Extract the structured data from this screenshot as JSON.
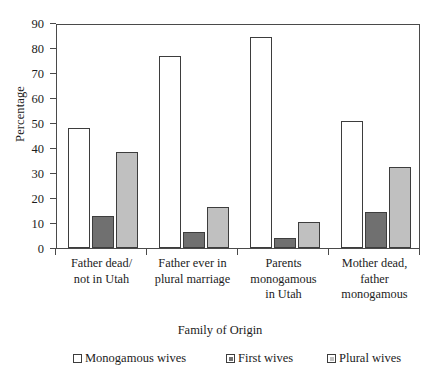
{
  "chart_data": {
    "type": "bar",
    "title": "",
    "xlabel": "Family of Origin",
    "ylabel": "Percentage",
    "ylim": [
      0,
      90
    ],
    "yticks": [
      0,
      10,
      20,
      30,
      40,
      50,
      60,
      70,
      80,
      90
    ],
    "grid": false,
    "legend_position": "bottom",
    "categories": [
      "Father dead/ not in Utah",
      "Father ever in plural marriage",
      "Parents monogamous in Utah",
      "Mother dead, father monogamous"
    ],
    "category_lines": [
      [
        "Father dead/",
        "not  in Utah"
      ],
      [
        "Father ever in",
        "plural marriage"
      ],
      [
        "Parents",
        "monogamous",
        "in Utah"
      ],
      [
        "Mother dead,",
        "father",
        "monogamous"
      ]
    ],
    "series": [
      {
        "name": "Monogamous wives",
        "color": "#ffffff",
        "values": [
          48,
          77,
          84.5,
          51
        ]
      },
      {
        "name": "First wives",
        "color": "#707070",
        "values": [
          13,
          6.5,
          4,
          14.5
        ]
      },
      {
        "name": "Plural wives",
        "color": "#c0c0c0",
        "values": [
          38.5,
          16.5,
          10.5,
          32.5
        ]
      }
    ]
  },
  "legend": {
    "items": [
      {
        "label": "Monogamous wives",
        "color": "#ffffff"
      },
      {
        "label": "First wives",
        "color": "#707070"
      },
      {
        "label": "Plural wives",
        "color": "#c0c0c0"
      }
    ]
  },
  "caption": ""
}
